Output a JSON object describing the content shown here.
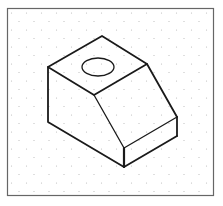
{
  "figure": {
    "colors": {
      "background": "#ffffff",
      "frame": "#666666",
      "dots": "#b8b8b8",
      "lines": "#1a1a1a"
    }
  }
}
